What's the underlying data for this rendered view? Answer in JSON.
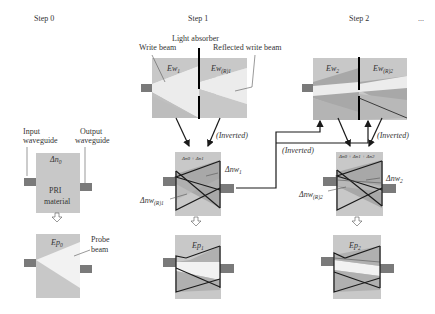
{
  "steps": [
    {
      "label": "Step 0"
    },
    {
      "label": "Step 1"
    },
    {
      "label": "Step 2"
    },
    {
      "label": "..."
    }
  ],
  "step0": {
    "input_waveguide": [
      "Input",
      "waveguide"
    ],
    "output_waveguide": [
      "Output",
      "waveguide"
    ],
    "index_label": "Δn",
    "index_sub": "0",
    "material": [
      "PRI",
      "material"
    ],
    "probe_field": "Ep",
    "probe_sub": "0",
    "probe_beam": [
      "Probe",
      "beam"
    ]
  },
  "step1": {
    "light_absorber": "Light absorber",
    "write_beam": "Write beam",
    "reflected_write_beam": "Reflected write beam",
    "ew": "Ew",
    "ew_sub": "1",
    "ewr": "Ew",
    "ewr_sub": "(R)1",
    "inverted": "(Inverted)",
    "index_label": "Δn0 + Δn1",
    "dnw": "Δnw",
    "dnw_sub": "1",
    "dnwr": "Δnw",
    "dnwr_sub": "(R)1",
    "probe_field": "Ep",
    "probe_sub": "1"
  },
  "step2": {
    "ew": "Ew",
    "ew_sub": "2",
    "ewr": "Ew",
    "ewr_sub": "(R)2",
    "inverted_left": "(Inverted)",
    "inverted_right": "(Inverted)",
    "index_label": "Δn0 + Δn1 + Δn2",
    "dnw": "Δnw",
    "dnw_sub": "2",
    "dnwr": "Δnw",
    "dnwr_sub": "(R)2",
    "probe_field": "Ep",
    "probe_sub": "2"
  },
  "colors": {
    "panel": "#c8c8c8",
    "beam": "#ececec",
    "dark": "#9a9a9a",
    "waveguide": "#7a7a7a",
    "line": "#1a1a1a"
  }
}
